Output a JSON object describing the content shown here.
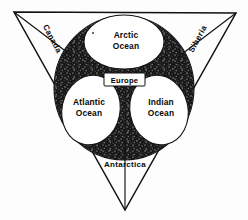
{
  "figure": {
    "background_color": "#fdfdfd",
    "ink_color": "#111111",
    "landmass_fill": "#1a1a1a",
    "ocean_fill": "#ffffff"
  },
  "corners": {
    "top_left": {
      "label": "Canada",
      "rotation_deg": 62
    },
    "top_right": {
      "label": "Siberia",
      "rotation_deg": -62
    },
    "bottom": {
      "label": "Antarctica",
      "rotation_deg": 0
    }
  },
  "oceans": [
    {
      "name": "arctic",
      "line1": "Arctic",
      "line2": "Ocean"
    },
    {
      "name": "atlantic",
      "line1": "Atlantic",
      "line2": "Ocean"
    },
    {
      "name": "indian",
      "line1": "Indian",
      "line2": "Ocean"
    }
  ],
  "continent": {
    "name": "europe",
    "label": "Europe"
  },
  "labels": {
    "arctic_line1": "Arctic",
    "arctic_line2": "Ocean",
    "atlantic_line1": "Atlantic",
    "atlantic_line2": "Ocean",
    "indian_line1": "Indian",
    "indian_line2": "Ocean",
    "europe": "Europe",
    "canada": "Canada",
    "siberia": "Siberia",
    "antarctica": "Antarctica"
  }
}
